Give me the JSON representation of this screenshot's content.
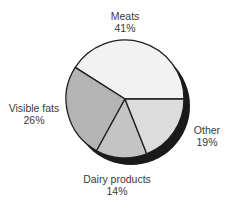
{
  "chart_data": {
    "type": "pie",
    "title": "",
    "categories": [
      "Meats",
      "Visible fats",
      "Dairy products",
      "Other"
    ],
    "values": [
      41,
      26,
      14,
      19
    ],
    "unit": "%",
    "labels": [
      {
        "name": "Meats",
        "value_text": "41%"
      },
      {
        "name": "Visible fats",
        "value_text": "26%"
      },
      {
        "name": "Dairy products",
        "value_text": "14%"
      },
      {
        "name": "Other",
        "value_text": "19%"
      }
    ],
    "colors": [
      "#f2f2f2",
      "#b4b4b4",
      "#c4c4c4",
      "#dcdcdc"
    ],
    "start_angle_deg": 0,
    "direction": "counterclockwise",
    "shadow": true,
    "legend": "none (direct labels)"
  },
  "style": {
    "outline_color": "#1e1e1e",
    "shadow_color": "#1a1a1a"
  }
}
